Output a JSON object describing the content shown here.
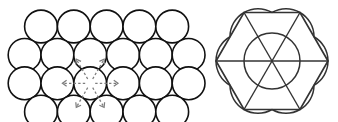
{
  "figure": {
    "background_color": "#ffffff",
    "left_panel": {
      "name": "hexagonal-close-packed-circles",
      "description": "Two-dimensional hexagonal close packing of equal circles",
      "circle_radius": 16.4,
      "circle_stroke_color": "#111111",
      "circle_fill_color": "#ffffff",
      "circle_stroke_width": 1.6,
      "row_spacing": 28.4,
      "rows": [
        {
          "index": 0,
          "count": 5,
          "cy": 26.5,
          "x_start": 41.0,
          "x_step": 32.8
        },
        {
          "index": 1,
          "count": 6,
          "cy": 54.9,
          "x_start": 24.6,
          "x_step": 32.8
        },
        {
          "index": 2,
          "count": 6,
          "cy": 83.3,
          "x_start": 24.6,
          "x_step": 32.8
        },
        {
          "index": 3,
          "count": 5,
          "cy": 111.7,
          "x_start": 41.0,
          "x_step": 32.8
        }
      ],
      "coordination_marker": {
        "name": "coordination-number-arrows",
        "center_x": 90.2,
        "center_y": 83.3,
        "arrow_count": 6,
        "arrow_color": "#7d7d7d",
        "arrow_style": "dashed",
        "arrow_length": 32.8,
        "angles_deg": [
          0,
          60,
          120,
          180,
          240,
          300
        ],
        "meaning": "coordination number 6"
      }
    },
    "right_panel": {
      "name": "hexagonal-unit-cell",
      "description": "Regular hexagon with three long diagonals, inscribed central circle and corner arcs",
      "center_x": 272.0,
      "center_y": 61.0,
      "circumradius": 56.0,
      "outline_color": "#333333",
      "outline_stroke_width": 1.7,
      "diagonal_color": "#333333",
      "diagonal_count": 3,
      "arc_color": "#333333",
      "inscribed_circle_radius": 28.0,
      "vertex_arc_radius": 28.0,
      "vertex_count": 6,
      "vertex_angles_deg": [
        0,
        60,
        120,
        180,
        240,
        300
      ]
    }
  }
}
